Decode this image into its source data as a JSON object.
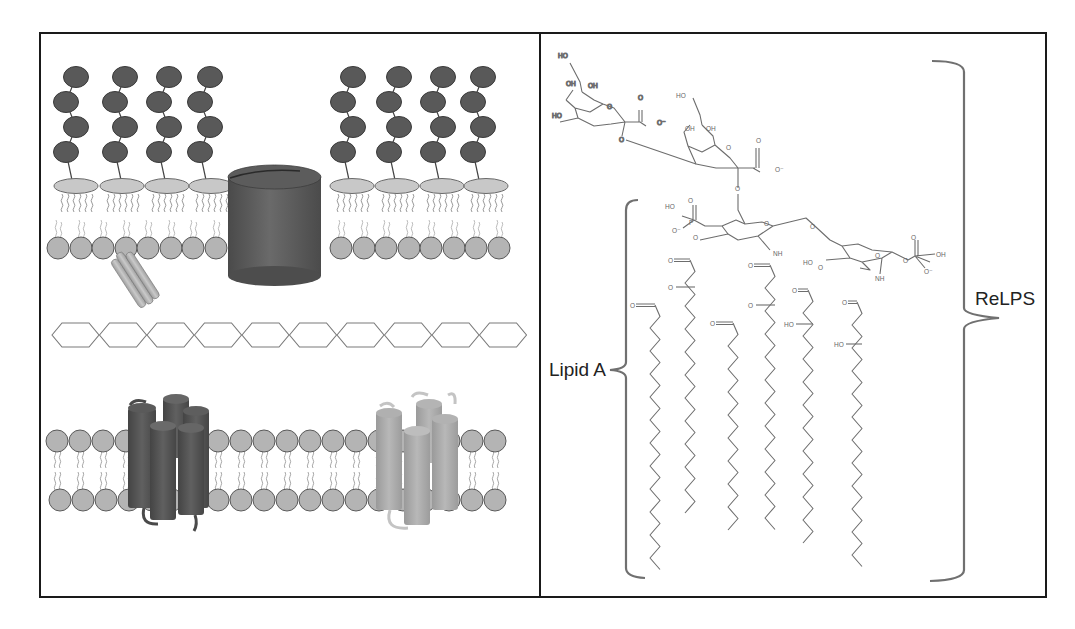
{
  "figure": {
    "frame": {
      "x": 40,
      "y": 33,
      "width": 1006,
      "height": 564,
      "divider_x": 540,
      "border_color": "#1a1a1a"
    },
    "colors": {
      "lps_bead": "#595959",
      "lps_bead_stroke": "#3a3a3a",
      "head_ellipse": "#c8c8c8",
      "head_circle": "#b4b4b4",
      "lipid_tail": "#9a9a9a",
      "porin": "#5a5a5a",
      "peptidoglycan_stroke": "#7a7a7a",
      "helix_dark": "#555555",
      "helix_light": "#a8a8a8",
      "lipoprotein": "#b0b0b0",
      "bond": "#6d6d6d",
      "bracket": "#707070"
    }
  },
  "left_panel": {
    "title": "Gram-negative cell envelope",
    "outer_membrane": {
      "lps_chains_left_x": [
        68,
        117,
        161,
        202
      ],
      "lps_chains_right_x": [
        345,
        391,
        435,
        475
      ],
      "lps_beads_per_chain": 4,
      "head_ellipses_left_x": [
        76,
        122,
        167,
        211
      ],
      "head_ellipses_right_x": [
        352,
        397,
        442,
        486
      ],
      "inner_leaflet_circles_left_x": [
        58,
        81,
        103,
        126,
        148,
        171,
        193,
        216
      ],
      "inner_leaflet_circles_right_x": [
        341,
        364,
        386,
        409,
        431,
        454,
        476,
        499
      ]
    },
    "porin": {
      "label": "porin",
      "cx": 274,
      "top": 170,
      "bottom": 272,
      "rx": 46
    },
    "lipoprotein": {
      "label": "Braun lipoprotein"
    },
    "peptidoglycan": {
      "label": "peptidoglycan",
      "hexagon_count": 10,
      "y": 335
    },
    "inner_membrane": {
      "top_circles_x": [
        57,
        80,
        103,
        126,
        149,
        218,
        241,
        264,
        287,
        310,
        333,
        356,
        379,
        403,
        472,
        495
      ],
      "bottom_circles_x": [
        60,
        83,
        106,
        129,
        152,
        218,
        241,
        264,
        287,
        310,
        333,
        356,
        379,
        403,
        472,
        495
      ]
    },
    "proteins": [
      {
        "name": "dark-transmembrane-protein",
        "label": "transmembrane protein (dark)"
      },
      {
        "name": "light-transmembrane-protein",
        "label": "transmembrane protein (light)"
      }
    ]
  },
  "right_panel": {
    "labels": {
      "lipid_a": "Lipid A",
      "relps": "ReLPS"
    },
    "atoms": {
      "ho": "HO",
      "oh": "OH",
      "o": "O",
      "o_minus": "O⁻",
      "p": "P",
      "nh": "NH",
      "carbonyl": "O="
    }
  }
}
